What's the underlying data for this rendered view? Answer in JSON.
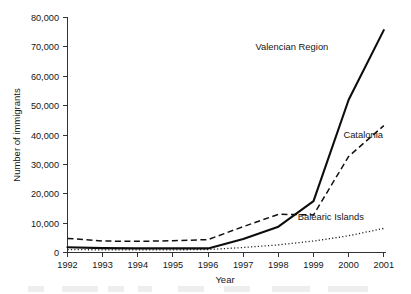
{
  "chart_data": {
    "type": "line",
    "title": "",
    "xlabel": "Year",
    "ylabel": "Number of immigrants",
    "categories": [
      "1992",
      "1993",
      "1994",
      "1995",
      "1996",
      "1997",
      "1998",
      "1999",
      "2000",
      "2001"
    ],
    "x": [
      1992,
      1993,
      1994,
      1995,
      1996,
      1997,
      1998,
      1999,
      2000,
      2001
    ],
    "xlim": [
      1992,
      2001
    ],
    "ylim": [
      0,
      80000
    ],
    "yticks": [
      0,
      10000,
      20000,
      30000,
      40000,
      50000,
      60000,
      70000,
      80000
    ],
    "ytick_labels": [
      "0",
      "10,000",
      "20,000",
      "30,000",
      "40,000",
      "50,000",
      "60,000",
      "70,000",
      "80,000"
    ],
    "grid": false,
    "legend_position": "inline-annotations",
    "series": [
      {
        "name": "Valencian Region",
        "style": "solid",
        "values": [
          1800,
          1500,
          1400,
          1400,
          1400,
          4600,
          8800,
          17500,
          52000,
          75700
        ]
      },
      {
        "name": "Catalonia",
        "style": "dashed",
        "values": [
          4800,
          3900,
          3800,
          4000,
          4400,
          8800,
          13000,
          12800,
          32700,
          43200
        ]
      },
      {
        "name": "Balearic Islands",
        "style": "dotted",
        "values": [
          1000,
          900,
          900,
          900,
          1000,
          1700,
          2600,
          3900,
          5700,
          8200
        ]
      }
    ],
    "annotations": [
      {
        "text": "Valencian Region",
        "x": 1997.35,
        "y": 69000
      },
      {
        "text": "Catalonia",
        "x": 1999.85,
        "y": 39000
      },
      {
        "text": "Balearic Islands",
        "x": 1998.55,
        "y": 11200
      }
    ]
  },
  "axis": {
    "y_title": "Number of immigrants",
    "x_title": "Year"
  }
}
